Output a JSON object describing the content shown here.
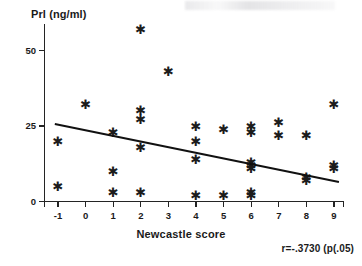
{
  "figure": {
    "y_axis_title": "Prl (ng/ml)",
    "x_axis_title": "Newcastle score",
    "stat_annotation": "r=-.3730 (p(.05)"
  },
  "chart_data": {
    "type": "scatter",
    "title": "",
    "xlabel": "Newcastle score",
    "ylabel": "Prl (ng/ml)",
    "xlim": [
      -1.55,
      9.7
    ],
    "ylim": [
      -1,
      59
    ],
    "grid": false,
    "legend": null,
    "xticks": [
      -1,
      0,
      1,
      2,
      3,
      4,
      5,
      6,
      7,
      8,
      9
    ],
    "xtick_labels": [
      "-1",
      "0",
      "1",
      "2",
      "3",
      "4",
      "5",
      "6",
      "7",
      "8",
      "9"
    ],
    "yticks": [
      0,
      25,
      50
    ],
    "ytick_labels": [
      "0",
      "25",
      "50"
    ],
    "marker": "asterisk",
    "points": [
      {
        "x": -1,
        "y": 20
      },
      {
        "x": -1,
        "y": 5
      },
      {
        "x": 0,
        "y": 32
      },
      {
        "x": 1,
        "y": 23
      },
      {
        "x": 1,
        "y": 10
      },
      {
        "x": 1,
        "y": 3
      },
      {
        "x": 2,
        "y": 57
      },
      {
        "x": 2,
        "y": 30
      },
      {
        "x": 2,
        "y": 27
      },
      {
        "x": 2,
        "y": 18
      },
      {
        "x": 2,
        "y": 3
      },
      {
        "x": 3,
        "y": 43
      },
      {
        "x": 4,
        "y": 25
      },
      {
        "x": 4,
        "y": 20
      },
      {
        "x": 4,
        "y": 14
      },
      {
        "x": 4,
        "y": 2
      },
      {
        "x": 5,
        "y": 24
      },
      {
        "x": 5,
        "y": 2
      },
      {
        "x": 6,
        "y": 25
      },
      {
        "x": 6,
        "y": 23
      },
      {
        "x": 6,
        "y": 13
      },
      {
        "x": 6,
        "y": 12
      },
      {
        "x": 6,
        "y": 11
      },
      {
        "x": 6,
        "y": 3
      },
      {
        "x": 6,
        "y": 2
      },
      {
        "x": 7,
        "y": 26
      },
      {
        "x": 7,
        "y": 22
      },
      {
        "x": 8,
        "y": 22
      },
      {
        "x": 8,
        "y": 8
      },
      {
        "x": 8,
        "y": 7
      },
      {
        "x": 9,
        "y": 32
      },
      {
        "x": 9,
        "y": 12
      },
      {
        "x": 9,
        "y": 11
      }
    ],
    "trendline": {
      "type": "linear-fit",
      "x_start": -1.1,
      "y_start": 26.0,
      "x_end": 9.2,
      "y_end": 6.8,
      "r": -0.373,
      "p_text": "p(.05"
    }
  },
  "icons": {
    "data_marker_glyph": "✱"
  }
}
